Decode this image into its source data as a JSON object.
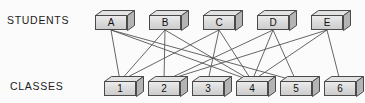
{
  "diagram": {
    "type": "bipartite-graph",
    "row_labels": {
      "top": "STUDENTS",
      "bottom": "CLASSES"
    },
    "colors": {
      "node_fill_light": "#ececec",
      "node_fill_dark": "#cdcdcd",
      "node_side": "#b4b4b4",
      "node_top": "#e2e2e2",
      "node_stroke": "#4a4a4a",
      "edge_stroke": "#555555",
      "text": "#111111",
      "background": "#fbfbfb"
    },
    "students": [
      {
        "id": "A",
        "label": "A",
        "x": 95,
        "y": 10
      },
      {
        "id": "B",
        "label": "B",
        "x": 149,
        "y": 10
      },
      {
        "id": "C",
        "label": "C",
        "x": 203,
        "y": 10
      },
      {
        "id": "D",
        "label": "D",
        "x": 257,
        "y": 10
      },
      {
        "id": "E",
        "label": "E",
        "x": 311,
        "y": 10
      }
    ],
    "classes": [
      {
        "id": "1",
        "label": "1",
        "x": 104,
        "y": 76
      },
      {
        "id": "2",
        "label": "2",
        "x": 148,
        "y": 76
      },
      {
        "id": "3",
        "label": "3",
        "x": 192,
        "y": 76
      },
      {
        "id": "4",
        "label": "4",
        "x": 236,
        "y": 76
      },
      {
        "id": "5",
        "label": "5",
        "x": 280,
        "y": 76
      },
      {
        "id": "6",
        "label": "6",
        "x": 324,
        "y": 76
      }
    ],
    "edges": [
      {
        "from": "A",
        "to": "1"
      },
      {
        "from": "A",
        "to": "4"
      },
      {
        "from": "A",
        "to": "5"
      },
      {
        "from": "B",
        "to": "1"
      },
      {
        "from": "B",
        "to": "2"
      },
      {
        "from": "B",
        "to": "4"
      },
      {
        "from": "C",
        "to": "1"
      },
      {
        "from": "C",
        "to": "3"
      },
      {
        "from": "C",
        "to": "4"
      },
      {
        "from": "D",
        "to": "2"
      },
      {
        "from": "D",
        "to": "4"
      },
      {
        "from": "D",
        "to": "5"
      },
      {
        "from": "E",
        "to": "2"
      },
      {
        "from": "E",
        "to": "4"
      },
      {
        "from": "E",
        "to": "6"
      }
    ]
  }
}
